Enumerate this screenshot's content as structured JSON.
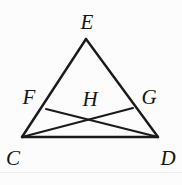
{
  "figure": {
    "kind": "geometry-diagram",
    "width": 182,
    "height": 185,
    "background_color": "#fcfcfc",
    "stroke_color": "#1a1a1a",
    "label_color": "#151515",
    "stroke_width": 2.2,
    "points": [
      {
        "id": "E",
        "label": "E",
        "x": 86,
        "y": 39,
        "label_x": 87,
        "label_y": 22
      },
      {
        "id": "C",
        "label": "C",
        "x": 22,
        "y": 137,
        "label_x": 13,
        "label_y": 158
      },
      {
        "id": "D",
        "label": "D",
        "x": 158,
        "y": 137,
        "label_x": 168,
        "label_y": 158
      },
      {
        "id": "F",
        "label": "F",
        "x": 46,
        "y": 109,
        "label_x": 29,
        "label_y": 97
      },
      {
        "id": "G",
        "label": "G",
        "x": 133,
        "y": 108,
        "label_x": 149,
        "label_y": 97
      },
      {
        "id": "H",
        "label": "H",
        "x": 92,
        "y": 118,
        "label_x": 90,
        "label_y": 99
      }
    ],
    "segments": [
      {
        "id": "EC",
        "from": "E",
        "to": "C",
        "x1": 86,
        "y1": 39,
        "x2": 22,
        "y2": 137
      },
      {
        "id": "ED",
        "from": "E",
        "to": "D",
        "x1": 86,
        "y1": 39,
        "x2": 158,
        "y2": 137
      },
      {
        "id": "CD",
        "from": "C",
        "to": "D",
        "x1": 22,
        "y1": 137,
        "x2": 158,
        "y2": 137
      },
      {
        "id": "CG",
        "from": "C",
        "to": "G",
        "x1": 22,
        "y1": 137,
        "x2": 133,
        "y2": 108
      },
      {
        "id": "FD",
        "from": "F",
        "to": "D",
        "x1": 46,
        "y1": 109,
        "x2": 158,
        "y2": 137
      }
    ],
    "scan_edge_y": 172
  }
}
